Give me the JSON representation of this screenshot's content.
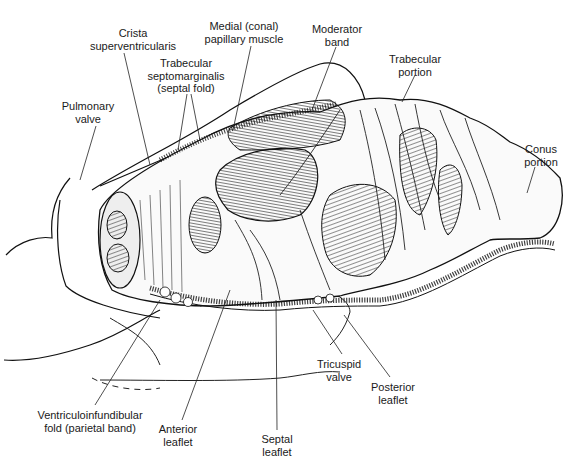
{
  "figure": {
    "labels": [
      {
        "id": "crista",
        "lines": [
          "Crista",
          "superventricularis"
        ],
        "x": 133,
        "y": 27
      },
      {
        "id": "medial-papillary",
        "lines": [
          "Medial (conal)",
          "papillary muscle"
        ],
        "x": 244,
        "y": 20
      },
      {
        "id": "moderator-band",
        "lines": [
          "Moderator",
          "band"
        ],
        "x": 337,
        "y": 23
      },
      {
        "id": "trabecular-septomarginalis",
        "lines": [
          "Trabecular",
          "septomarginalis",
          "(septal fold)"
        ],
        "x": 186,
        "y": 57
      },
      {
        "id": "pulmonary-valve",
        "lines": [
          "Pulmonary",
          "valve"
        ],
        "x": 88,
        "y": 100
      },
      {
        "id": "trabecular-portion",
        "lines": [
          "Trabecular",
          "portion"
        ],
        "x": 415,
        "y": 53
      },
      {
        "id": "conus-portion",
        "lines": [
          "Conus",
          "portion"
        ],
        "x": 541,
        "y": 143
      },
      {
        "id": "tricuspid-valve",
        "lines": [
          "Tricuspid",
          "valve"
        ],
        "x": 339,
        "y": 358
      },
      {
        "id": "posterior-leaflet",
        "lines": [
          "Posterior",
          "leaflet"
        ],
        "x": 393,
        "y": 381
      },
      {
        "id": "ventriculoinfundibular-fold",
        "lines": [
          "Ventriculoinfundibular",
          "fold (parietal band)"
        ],
        "x": 90,
        "y": 409
      },
      {
        "id": "anterior-leaflet",
        "lines": [
          "Anterior",
          "leaflet"
        ],
        "x": 178,
        "y": 423
      },
      {
        "id": "septal-leaflet",
        "lines": [
          "Septal",
          "leaflet"
        ],
        "x": 277,
        "y": 433
      }
    ]
  },
  "labels": {
    "crista": {
      "l1": "Crista",
      "l2": "superventricularis"
    },
    "medial": {
      "l1": "Medial (conal)",
      "l2": "papillary muscle"
    },
    "moderator": {
      "l1": "Moderator",
      "l2": "band"
    },
    "septo": {
      "l1": "Trabecular",
      "l2": "septomarginalis",
      "l3": "(septal fold)"
    },
    "pulmonary": {
      "l1": "Pulmonary",
      "l2": "valve"
    },
    "trabecular": {
      "l1": "Trabecular",
      "l2": "portion"
    },
    "conus": {
      "l1": "Conus",
      "l2": "portion"
    },
    "tricuspid": {
      "l1": "Tricuspid",
      "l2": "valve"
    },
    "posterior": {
      "l1": "Posterior",
      "l2": "leaflet"
    },
    "vif": {
      "l1": "Ventriculoinfundibular",
      "l2": "fold (parietal band)"
    },
    "anterior": {
      "l1": "Anterior",
      "l2": "leaflet"
    },
    "septal": {
      "l1": "Septal",
      "l2": "leaflet"
    }
  }
}
